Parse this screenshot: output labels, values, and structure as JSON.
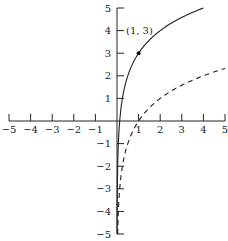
{
  "chart_data": {
    "type": "line",
    "title": "",
    "xlabel": "",
    "ylabel": "",
    "xlim": [
      -5,
      5
    ],
    "ylim": [
      -5,
      5
    ],
    "grid": false,
    "x_ticks": [
      -5,
      -4,
      -3,
      -2,
      -1,
      1,
      2,
      3,
      4,
      5
    ],
    "x_tick_labels": [
      "−5",
      "−4",
      "−3",
      "−2",
      "−1",
      "1",
      "2",
      "3",
      "4",
      "5"
    ],
    "y_ticks": [
      5,
      4,
      3,
      2,
      1,
      -1,
      -2,
      -3,
      -4,
      -5
    ],
    "y_tick_labels": [
      "5",
      "4",
      "3",
      "2",
      "1",
      "−1",
      "−2",
      "−3",
      "−4",
      "−5"
    ],
    "series": [
      {
        "name": "y = 3 + log2(x)",
        "style": "solid",
        "x": [
          0.016,
          0.03,
          0.0625,
          0.125,
          0.25,
          0.5,
          1,
          2,
          3,
          4
        ],
        "y": [
          -3,
          -2.06,
          -1,
          0,
          1,
          2,
          3,
          4,
          4.58,
          5
        ]
      },
      {
        "name": "y = log2(x)",
        "style": "dashed",
        "x": [
          0.035,
          0.0625,
          0.125,
          0.25,
          0.5,
          1,
          2,
          3,
          4,
          5
        ],
        "y": [
          -4.84,
          -4,
          -3,
          -2,
          -1,
          0,
          1,
          1.58,
          2,
          2.32
        ]
      }
    ],
    "annotations": [
      {
        "text": "(1, 3)",
        "point": [
          1,
          3
        ],
        "marker": "filled-dot"
      }
    ]
  },
  "labels": {
    "point_label": "(1, 3)"
  }
}
